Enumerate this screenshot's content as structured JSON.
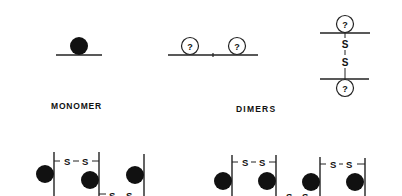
{
  "labels": {
    "monomer": "MONOMER",
    "dimers": "DIMERS"
  },
  "symbols": {
    "unknown": "?",
    "sulfur": "S",
    "bond": "S–S"
  },
  "colors": {
    "ink": "#111111",
    "background": "#ffffff"
  },
  "icons": {
    "filled_ball": "filled-circle-icon",
    "unknown_ball": "question-circle-icon"
  }
}
